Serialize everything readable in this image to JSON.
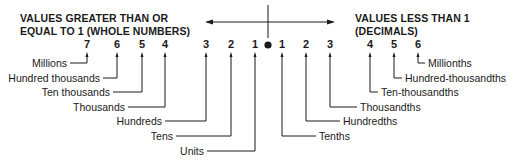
{
  "diagram": {
    "title_left": [
      "VALUES GREATER THAN OR",
      "EQUAL TO 1 (WHOLE NUMBERS)"
    ],
    "title_right": [
      "VALUES LESS THAN 1",
      "(DECIMALS)"
    ],
    "decimal_point": "●",
    "whole_places": [
      {
        "digit": "7",
        "label": "Millions"
      },
      {
        "digit": "6",
        "label": "Hundred thousands"
      },
      {
        "digit": "5",
        "label": "Ten thousands"
      },
      {
        "digit": "4",
        "label": "Thousands"
      },
      {
        "digit": "3",
        "label": "Hundreds"
      },
      {
        "digit": "2",
        "label": "Tens"
      },
      {
        "digit": "1",
        "label": "Units"
      }
    ],
    "decimal_places": [
      {
        "digit": "1",
        "label": "Tenths"
      },
      {
        "digit": "2",
        "label": "Hundredths"
      },
      {
        "digit": "3",
        "label": "Thousandths"
      },
      {
        "digit": "4",
        "label": "Ten-thousandths"
      },
      {
        "digit": "5",
        "label": "Hundred-thousandths"
      },
      {
        "digit": "6",
        "label": "Millionths"
      }
    ],
    "colors": {
      "ink": "#1a1a1a",
      "background": "#ffffff"
    }
  }
}
